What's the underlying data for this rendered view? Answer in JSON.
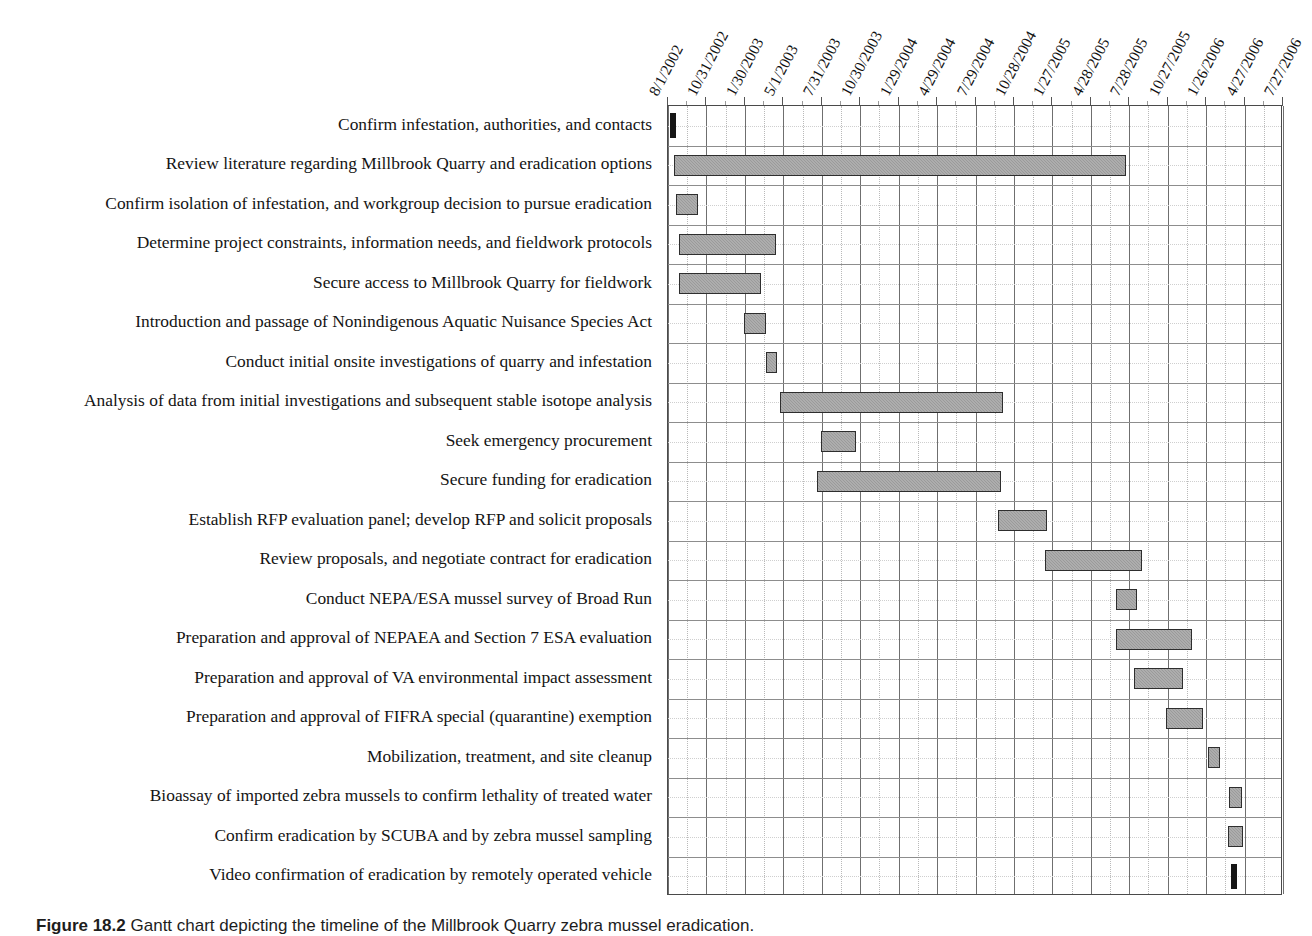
{
  "figure": {
    "caption_number": "Figure 18.2",
    "caption_text": "Gantt chart depicting the timeline of the Millbrook Quarry zebra mussel eradication."
  },
  "chart_data": {
    "type": "bar",
    "title": "",
    "xlabel": "",
    "ylabel": "",
    "orientation": "horizontal",
    "grid": true,
    "legend": "none",
    "x_axis": {
      "type": "date",
      "start": "8/1/2002",
      "end": "7/27/2006",
      "tick_interval_days": 91,
      "tick_labels": [
        "8/1/2002",
        "10/31/2002",
        "1/30/2003",
        "5/1/2003",
        "7/31/2003",
        "10/30/2003",
        "1/29/2004",
        "4/29/2004",
        "7/29/2004",
        "10/28/2004",
        "1/27/2005",
        "4/28/2005",
        "7/28/2005",
        "10/27/2005",
        "1/26/2006",
        "4/27/2006",
        "7/27/2006"
      ]
    },
    "categories": [
      "Confirm infestation, authorities, and contacts",
      "Review literature regarding Millbrook Quarry and eradication options",
      "Confirm isolation of infestation, and workgroup decision to pursue eradication",
      "Determine project constraints, information needs, and fieldwork protocols",
      "Secure access to Millbrook Quarry for fieldwork",
      "Introduction and passage of Nonindigenous Aquatic Nuisance Species Act",
      "Conduct initial onsite investigations of quarry and infestation",
      "Analysis of data from initial investigations and subsequent stable isotope analysis",
      "Seek emergency procurement",
      "Secure funding for eradication",
      "Establish RFP evaluation panel; develop RFP and solicit proposals",
      "Review proposals, and negotiate contract for eradication",
      "Conduct NEPA/ESA mussel survey of Broad Run",
      "Preparation and approval of NEPAEA and Section 7 ESA evaluation",
      "Preparation and approval of VA environmental impact assessment",
      "Preparation and approval of FIFRA special (quarantine) exemption",
      "Mobilization, treatment, and site cleanup",
      "Bioassay of imported zebra mussels to confirm lethality of treated water",
      "Confirm eradication by SCUBA and by zebra mussel sampling",
      "Video confirmation of eradication by remotely operated vehicle"
    ],
    "tasks": [
      {
        "label": "Confirm infestation, authorities, and contacts",
        "start": "8/1/2002",
        "end": "8/10/2002",
        "milestone": true,
        "start_frac": 0.005,
        "end_frac": 0.012
      },
      {
        "label": "Review literature regarding Millbrook Quarry and eradication options",
        "start": "8/5/2002",
        "end": "4/10/2005",
        "milestone": false,
        "start_frac": 0.01,
        "end_frac": 0.745
      },
      {
        "label": "Confirm isolation of infestation, and workgroup decision to pursue eradication",
        "start": "8/8/2002",
        "end": "10/12/2002",
        "milestone": false,
        "start_frac": 0.013,
        "end_frac": 0.048
      },
      {
        "label": "Determine project constraints, information needs, and fieldwork protocols",
        "start": "8/20/2002",
        "end": "5/1/2003",
        "milestone": false,
        "start_frac": 0.018,
        "end_frac": 0.175
      },
      {
        "label": "Secure access to Millbrook Quarry for fieldwork",
        "start": "8/20/2002",
        "end": "4/10/2003",
        "milestone": false,
        "start_frac": 0.018,
        "end_frac": 0.152
      },
      {
        "label": "Introduction and passage of Nonindigenous Aquatic Nuisance Species Act",
        "start": "3/15/2003",
        "end": "5/20/2003",
        "milestone": false,
        "start_frac": 0.123,
        "end_frac": 0.16
      },
      {
        "label": "Conduct initial onsite investigations of quarry and infestation",
        "start": "5/10/2003",
        "end": "6/15/2003",
        "milestone": false,
        "start_frac": 0.16,
        "end_frac": 0.178
      },
      {
        "label": "Analysis of data from initial investigations and subsequent stable isotope analysis",
        "start": "6/10/2003",
        "end": "11/20/2004",
        "milestone": false,
        "start_frac": 0.182,
        "end_frac": 0.545
      },
      {
        "label": "Seek emergency procurement",
        "start": "8/20/2003",
        "end": "11/20/2003",
        "milestone": false,
        "start_frac": 0.248,
        "end_frac": 0.305
      },
      {
        "label": "Secure funding for eradication",
        "start": "8/15/2003",
        "end": "11/15/2004",
        "milestone": false,
        "start_frac": 0.243,
        "end_frac": 0.542
      },
      {
        "label": "Establish RFP evaluation panel; develop RFP and solicit proposals",
        "start": "11/1/2004",
        "end": "2/20/2005",
        "milestone": false,
        "start_frac": 0.537,
        "end_frac": 0.617
      },
      {
        "label": "Review proposals, and negotiate contract for eradication",
        "start": "2/20/2005",
        "end": "6/25/2005",
        "milestone": false,
        "start_frac": 0.613,
        "end_frac": 0.77
      },
      {
        "label": "Conduct NEPA/ESA mussel survey of Broad Run",
        "start": "6/20/2005",
        "end": "8/1/2005",
        "milestone": false,
        "start_frac": 0.728,
        "end_frac": 0.763
      },
      {
        "label": "Preparation and approval of NEPAEA and Section 7 ESA evaluation",
        "start": "6/25/2005",
        "end": "9/20/2005",
        "milestone": false,
        "start_frac": 0.728,
        "end_frac": 0.852
      },
      {
        "label": "Preparation and approval of VA environmental impact assessment",
        "start": "7/20/2005",
        "end": "9/15/2005",
        "milestone": false,
        "start_frac": 0.757,
        "end_frac": 0.838
      },
      {
        "label": "Preparation and approval of FIFRA special (quarantine) exemption",
        "start": "8/25/2005",
        "end": "10/20/2005",
        "milestone": false,
        "start_frac": 0.81,
        "end_frac": 0.87
      },
      {
        "label": "Mobilization, treatment, and site cleanup",
        "start": "12/20/2005",
        "end": "1/20/2006",
        "milestone": false,
        "start_frac": 0.878,
        "end_frac": 0.898
      },
      {
        "label": "Bioassay of imported zebra mussels to confirm lethality of treated water",
        "start": "2/20/2006",
        "end": "3/20/2006",
        "milestone": false,
        "start_frac": 0.913,
        "end_frac": 0.933
      },
      {
        "label": "Confirm eradication by SCUBA and by zebra mussel sampling",
        "start": "2/15/2006",
        "end": "3/25/2006",
        "milestone": false,
        "start_frac": 0.91,
        "end_frac": 0.935
      },
      {
        "label": "Video confirmation of eradication by remotely operated vehicle",
        "start": "3/1/2006",
        "end": "3/10/2006",
        "milestone": true,
        "start_frac": 0.917,
        "end_frac": 0.924
      }
    ],
    "colors": {
      "bar_fill": "#9a9a9a",
      "bar_border": "#2e2e2e",
      "milestone": "#161616",
      "grid_major": "#6f6f6f",
      "grid_minor": "#cfcfcf",
      "plot_border": "#4a4a4a",
      "background": "#ffffff",
      "text": "#141414"
    }
  }
}
